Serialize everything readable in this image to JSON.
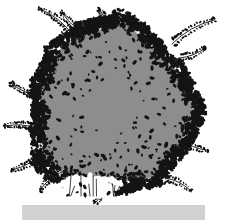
{
  "image": {
    "title": "Shrub habit illustration",
    "subject_name": "shrub",
    "caption": "",
    "width": 226,
    "height": 220,
    "background_color": "#ffffff"
  },
  "scene": {
    "canopy": {
      "label": "shrub-canopy",
      "fill_color": "#8d8d8d",
      "outline_color": "#1a1a1a",
      "center_x": 112,
      "center_y": 108,
      "radius_x": 78,
      "radius_y": 82,
      "shape": "rounded-irregular-mass"
    },
    "foliage": {
      "label": "stippled-foliage-band",
      "leaf_color": "#141414",
      "band_inner_radius_ratio": 0.84,
      "band_outer_radius_ratio": 1.1,
      "leaf_count": 1400,
      "interior_speckle_count": 120,
      "leaf_min_size": 1.0,
      "leaf_max_size": 2.9
    },
    "branches": {
      "label": "protruding-twigs",
      "stroke_color": "#101010",
      "items": [
        {
          "name": "twig-upper-left",
          "x1": 72,
          "y1": 34,
          "x2": 40,
          "y2": 9,
          "leaflets": 13
        },
        {
          "name": "twig-top-left-inner",
          "x1": 80,
          "y1": 30,
          "x2": 62,
          "y2": 12,
          "leaflets": 10
        },
        {
          "name": "twig-top-center",
          "x1": 106,
          "y1": 24,
          "x2": 100,
          "y2": 10,
          "leaflets": 8
        },
        {
          "name": "twig-upper-right",
          "x1": 172,
          "y1": 44,
          "x2": 214,
          "y2": 20,
          "leaflets": 14
        },
        {
          "name": "twig-right-upper",
          "x1": 180,
          "y1": 58,
          "x2": 205,
          "y2": 48,
          "leaflets": 9
        },
        {
          "name": "twig-left-mid",
          "x1": 40,
          "y1": 96,
          "x2": 12,
          "y2": 84,
          "leaflets": 12
        },
        {
          "name": "twig-left-lower",
          "x1": 36,
          "y1": 128,
          "x2": 6,
          "y2": 126,
          "leaflets": 13
        },
        {
          "name": "twig-lower-left",
          "x1": 44,
          "y1": 152,
          "x2": 12,
          "y2": 170,
          "leaflets": 12
        },
        {
          "name": "twig-bottom-left",
          "x1": 62,
          "y1": 172,
          "x2": 40,
          "y2": 190,
          "leaflets": 9
        },
        {
          "name": "twig-bottom-center",
          "x1": 104,
          "y1": 186,
          "x2": 96,
          "y2": 202,
          "leaflets": 7
        },
        {
          "name": "twig-right-lower",
          "x1": 182,
          "y1": 140,
          "x2": 206,
          "y2": 150,
          "leaflets": 8
        },
        {
          "name": "twig-bottom-right",
          "x1": 166,
          "y1": 178,
          "x2": 190,
          "y2": 190,
          "leaflets": 8
        }
      ]
    },
    "trunk_gap": {
      "label": "trunk-stem-gap",
      "fill_color": "#fdfdfd",
      "center_x": 92,
      "center_y": 186,
      "width": 58,
      "height": 22
    },
    "ground_bar": {
      "label": "ground-plane-bar",
      "fill_color": "#d2d2d2",
      "x": 22,
      "y": 205,
      "width": 183,
      "height": 15
    }
  }
}
